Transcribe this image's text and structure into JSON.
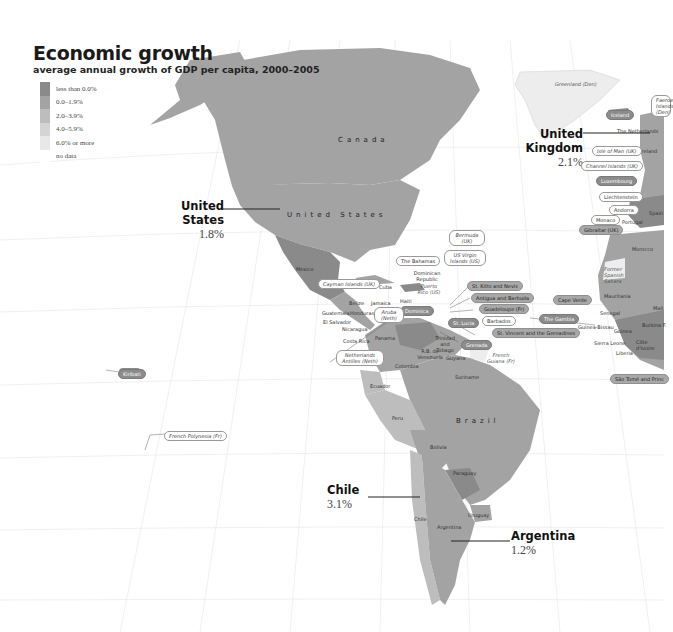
{
  "title": "Economic growth",
  "subtitle": "average annual growth of GDP per capita, 2000–2005",
  "legend": [
    {
      "label": "less than 0.0%",
      "color": "#8a8a8a"
    },
    {
      "label": "0.0–1.9%",
      "color": "#a3a3a3"
    },
    {
      "label": "2.0–3.9%",
      "color": "#bdbdbd"
    },
    {
      "label": "4.0–5.9%",
      "color": "#d4d4d4"
    },
    {
      "label": "6.0% or more",
      "color": "#e8e8e8"
    },
    {
      "label": "no data",
      "color": "#ffffff"
    }
  ],
  "highlights": {
    "us": {
      "name": "United States",
      "value": "1.8%"
    },
    "uk": {
      "name": "United Kingdom",
      "value": "2.1%"
    },
    "chile": {
      "name": "Chile",
      "value": "3.1%"
    },
    "argentina": {
      "name": "Argentina",
      "value": "1.2%"
    }
  },
  "regions": {
    "canada": "Canada",
    "united_states": "United States",
    "brazil": "Brazil",
    "greenland": "Greenland (Den)",
    "mexico": "Mexico",
    "cuba": "Cuba",
    "jamaica": "Jamaica",
    "haiti": "Haiti",
    "dominican_republic": "Dominican Republic",
    "puerto_rico": "Puerto Rico (US)",
    "belize": "Belize",
    "guatemala": "Guatemala",
    "honduras": "Honduras",
    "el_salvador": "El Salvador",
    "nicaragua": "Nicaragua",
    "costa_rica": "Costa Rica",
    "panama": "Panama",
    "colombia": "Colombia",
    "venezuela": "R.B. de Venezuela",
    "trinidad": "Trinidad and Tobago",
    "guyana": "Guyana",
    "suriname": "Suriname",
    "french_guiana": "French Guiana (Fr)",
    "ecuador": "Ecuador",
    "peru": "Peru",
    "bolivia": "Bolivia",
    "paraguay": "Paraguay",
    "uruguay": "Uruguay",
    "chile": "Chile",
    "argentina": "Argentina",
    "netherlands": "The Netherlands",
    "portugal": "Portugal",
    "spain": "Spain",
    "morocco": "Morocco",
    "western_sahara": "Former Spanish Sahara",
    "mauritania": "Mauritania",
    "mali": "Mali",
    "senegal": "Senegal",
    "guinea_bissau": "Guinea-Bissau",
    "guinea": "Guinea",
    "sierra_leone": "Sierra Leone",
    "liberia": "Liberia",
    "burkina": "Burkina F.",
    "cote_divoire": "Côte d'Ivoire",
    "ireland": "Ireland",
    "faeroe": "Faeroe Islands (Den)"
  },
  "callouts": [
    {
      "id": "iceland",
      "label": "Iceland",
      "style": "dark"
    },
    {
      "id": "isle_of_man",
      "label": "Isle of Man (UK)",
      "style": "light"
    },
    {
      "id": "channel_islands",
      "label": "Channel Islands (UK)",
      "style": "light"
    },
    {
      "id": "luxembourg",
      "label": "Luxembourg",
      "style": "dark"
    },
    {
      "id": "liechtenstein",
      "label": "Liechtenstein",
      "style": "outline"
    },
    {
      "id": "andorra",
      "label": "Andorra",
      "style": "outline"
    },
    {
      "id": "monaco",
      "label": "Monaco",
      "style": "outline"
    },
    {
      "id": "gibraltar",
      "label": "Gibraltar (UK)",
      "style": "mid"
    },
    {
      "id": "bermuda",
      "label": "Bermuda (UK)",
      "style": "light"
    },
    {
      "id": "bahamas",
      "label": "The Bahamas",
      "style": "outline"
    },
    {
      "id": "us_virgin",
      "label": "US Virgin Islands (US)",
      "style": "light"
    },
    {
      "id": "cayman",
      "label": "Cayman Islands (UK)",
      "style": "light"
    },
    {
      "id": "st_kitts",
      "label": "St. Kitts and Nevis",
      "style": "mid"
    },
    {
      "id": "antigua",
      "label": "Antigua and Barbuda",
      "style": "mid"
    },
    {
      "id": "guadeloupe",
      "label": "Guadeloupe (Fr)",
      "style": "mid"
    },
    {
      "id": "cape_verde",
      "label": "Cape Verde",
      "style": "mid"
    },
    {
      "id": "dominica",
      "label": "Dominica",
      "style": "dark"
    },
    {
      "id": "aruba",
      "label": "Aruba (Neth)",
      "style": "light"
    },
    {
      "id": "barbados",
      "label": "Barbados",
      "style": "outline"
    },
    {
      "id": "gambia",
      "label": "The Gambia",
      "style": "dark"
    },
    {
      "id": "st_lucia",
      "label": "St. Lucia",
      "style": "dark"
    },
    {
      "id": "st_vincent",
      "label": "St. Vincent and the Grenadines",
      "style": "mid"
    },
    {
      "id": "grenada",
      "label": "Grenada",
      "style": "dark"
    },
    {
      "id": "neth_antilles",
      "label": "Netherlands Antilles (Neth)",
      "style": "light"
    },
    {
      "id": "kiribati",
      "label": "Kiribati",
      "style": "dark"
    },
    {
      "id": "french_polynesia",
      "label": "French Polynesia (Fr)",
      "style": "light"
    },
    {
      "id": "sao_tome",
      "label": "São Tomé and Princ",
      "style": "mid"
    }
  ]
}
